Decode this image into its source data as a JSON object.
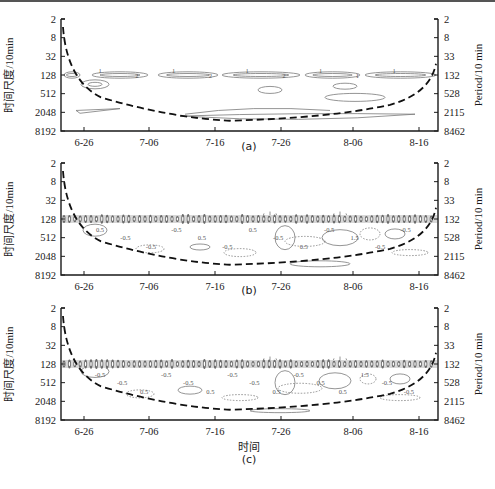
{
  "chart_data": [
    {
      "type": "heatmap",
      "subtype": "wavelet-contour",
      "panel": "(a)",
      "ylabel_left": "时间尺度/10min",
      "ylabel_right": "Period/10 min",
      "xlabel": "",
      "x_ticks": [
        "6-26",
        "7-06",
        "7-16",
        "7-26",
        "8-06",
        "8-16"
      ],
      "y_ticks_left": [
        "2",
        "8",
        "32",
        "128",
        "512",
        "2048",
        "8192"
      ],
      "y_ticks_right": [
        "2",
        "8",
        "33",
        "132",
        "528",
        "2115",
        "8462"
      ],
      "contour_labels": [
        "1",
        "2",
        "1",
        "2",
        "1",
        "2",
        "1",
        "1",
        "1"
      ],
      "annotations": [
        "cone of influence (dashed)"
      ],
      "dominant_band_period": 132
    },
    {
      "type": "heatmap",
      "subtype": "wavelet-contour",
      "panel": "(b)",
      "ylabel_left": "时间尺度/10min",
      "ylabel_right": "Period/10 min",
      "xlabel": "",
      "x_ticks": [
        "6-26",
        "7-06",
        "7-16",
        "7-26",
        "8-06",
        "8-16"
      ],
      "y_ticks_left": [
        "2",
        "8",
        "32",
        "128",
        "512",
        "2048",
        "8192"
      ],
      "y_ticks_right": [
        "2",
        "8",
        "33",
        "132",
        "528",
        "2115",
        "8462"
      ],
      "contour_labels": [
        "0.5",
        "-0.5",
        "-0.5",
        "-0.5",
        "0.5",
        "-0.5",
        "0.5",
        "-0.5",
        "0.5",
        "-0.5",
        "1.5",
        "-0.5",
        "-0.5"
      ],
      "annotations": [
        "cone of influence (dashed)"
      ],
      "dominant_band_period": 132
    },
    {
      "type": "heatmap",
      "subtype": "wavelet-contour",
      "panel": "(c)",
      "ylabel_left": "时间尺度/10min",
      "ylabel_right": "Period/10 min",
      "xlabel": "时间",
      "x_ticks": [
        "6-26",
        "7-06",
        "7-16",
        "7-26",
        "8-06",
        "8-16"
      ],
      "y_ticks_left": [
        "2",
        "8",
        "32",
        "128",
        "512",
        "2048",
        "8192"
      ],
      "y_ticks_right": [
        "2",
        "8",
        "33",
        "132",
        "528",
        "2115",
        "8462"
      ],
      "contour_labels": [
        "-0.5",
        "-0.5",
        "0.5",
        "-0.5",
        "-0.5",
        "0.5",
        "-0.5",
        "-0.5",
        "0.5",
        "-0.5",
        "0.5",
        "0.5",
        "1.5",
        "-0.5",
        "-0.5"
      ],
      "annotations": [
        "cone of influence (dashed)"
      ],
      "dominant_band_period": 132
    }
  ],
  "panels": [
    {
      "caption": "(a)",
      "top": 19
    },
    {
      "caption": "(b)",
      "top": 163
    },
    {
      "caption": "(c)",
      "top": 308
    }
  ],
  "axes": {
    "ylabel_left": "时间尺度/10min",
    "ylabel_right": "Period/10 min",
    "x_ticks": [
      "6-26",
      "7-06",
      "7-16",
      "7-26",
      "8-06",
      "8-16"
    ],
    "y_ticks_left": [
      "2",
      "8",
      "32",
      "128",
      "512",
      "2048",
      "8192"
    ],
    "y_ticks_right": [
      "2",
      "8",
      "33",
      "132",
      "528",
      "2115",
      "8462"
    ],
    "xlabel_bottom": "时间"
  },
  "colors": {
    "axis": "#1a1a1a",
    "contour": "#7a7a7a",
    "band": "#555555",
    "coi": "#111111"
  }
}
